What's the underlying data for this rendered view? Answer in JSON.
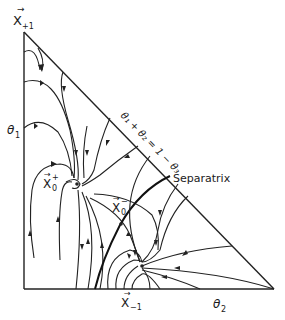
{
  "diagram": {
    "type": "phase-portrait-simplex",
    "vertices": {
      "top": {
        "label": "X",
        "subscript": "+1",
        "vector": true
      },
      "bottom_fixed_point": {
        "label": "X",
        "subscript": "−1",
        "vector": true
      }
    },
    "axes": {
      "vertical_label": "θ",
      "vertical_subscript": "1",
      "horizontal_label": "θ",
      "horizontal_subscript": "2"
    },
    "fixed_points": {
      "stable": {
        "label": "X",
        "subscript": "0",
        "superscript": "+",
        "vector": true
      },
      "saddle": {
        "label": "X",
        "subscript": "0",
        "superscript": "−",
        "vector": true
      }
    },
    "hypotenuse_equation": "θ₁ + θ₂ = 1 − θ₃",
    "separatrix_label": "Separatrix",
    "colors": {
      "ink": "#222222",
      "background": "#ffffff"
    }
  }
}
